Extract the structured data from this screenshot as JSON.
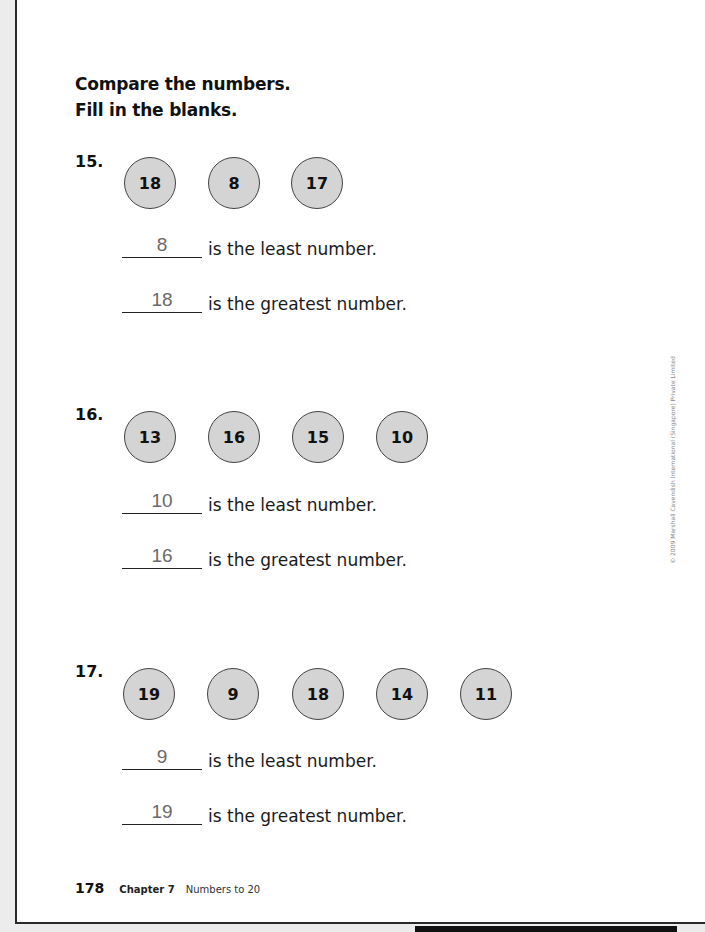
{
  "instructions": {
    "line1": "Compare the numbers.",
    "line2": "Fill in the blanks."
  },
  "questions": [
    {
      "label": "15.",
      "numbers": [
        "18",
        "8",
        "17"
      ],
      "least_answer": "8",
      "least_text": "is the least number.",
      "greatest_answer": "18",
      "greatest_text": "is the greatest number."
    },
    {
      "label": "16.",
      "numbers": [
        "13",
        "16",
        "15",
        "10"
      ],
      "least_answer": "10",
      "least_text": "is the least number.",
      "greatest_answer": "16",
      "greatest_text": "is the greatest number."
    },
    {
      "label": "17.",
      "numbers": [
        "19",
        "9",
        "18",
        "14",
        "11"
      ],
      "least_answer": "9",
      "least_text": "is the least number.",
      "greatest_answer": "19",
      "greatest_text": "is the greatest number."
    }
  ],
  "copyright": "© 2009 Marshall Cavendish International (Singapore) Private Limited",
  "footer": {
    "page_number": "178",
    "chapter": "Chapter 7",
    "chapter_title": "Numbers to 20"
  },
  "colors": {
    "circle_fill": "#d4d4d4",
    "answer_text": "#6a6a6a"
  }
}
